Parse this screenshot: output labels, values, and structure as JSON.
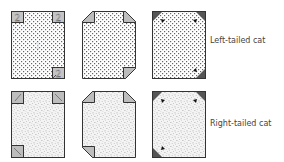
{
  "colors": {
    "outline": "#333333",
    "dots": "#555555",
    "speckle": "#9a9a9a",
    "fold_light": "#b8b8b8",
    "fold_dark": "#555555",
    "background": "#ffffff"
  },
  "rows": [
    {
      "id": "left-tailed",
      "pattern": "dots",
      "label": "Left-tailed cat",
      "panels": [
        {
          "stage": 1,
          "corner_label": "2",
          "center_label": "1"
        },
        {
          "stage": 2
        },
        {
          "stage": 3
        }
      ]
    },
    {
      "id": "right-tailed",
      "pattern": "speckle",
      "label": "Right-tailed cat",
      "panels": [
        {
          "stage": 1
        },
        {
          "stage": 2
        },
        {
          "stage": 3
        }
      ]
    }
  ]
}
